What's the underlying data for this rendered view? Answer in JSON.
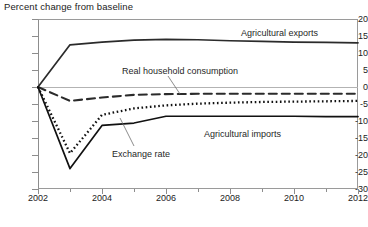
{
  "chart_data": {
    "type": "line",
    "title": "Percent change from baseline",
    "xlabel": "",
    "ylabel": "",
    "xlim": [
      2002,
      2012
    ],
    "ylim": [
      -30,
      20
    ],
    "ytick_values": [
      20,
      15,
      10,
      5,
      0,
      -5,
      -10,
      -15,
      -20,
      -25,
      -30
    ],
    "ytick_labels": [
      "20",
      "15",
      "10",
      "5",
      "0",
      "-5",
      "-10",
      "-15",
      "-20",
      "-25",
      "-30"
    ],
    "xtick_values": [
      2002,
      2004,
      2006,
      2008,
      2010,
      2012
    ],
    "xtick_labels": [
      "2002",
      "2004",
      "2006",
      "2008",
      "2010",
      "2012"
    ],
    "xtick_minor_values": [
      2003,
      2005,
      2007,
      2009,
      2011
    ],
    "grid": false,
    "legend_position": "inline-annotations",
    "x": [
      2002,
      2003,
      2004,
      2005,
      2006,
      2007,
      2008,
      2009,
      2010,
      2011,
      2012
    ],
    "series": [
      {
        "name": "Agricultural exports",
        "style": "solid",
        "color": "#2b2b2b",
        "values": [
          0,
          12.4,
          13.2,
          13.8,
          14.0,
          13.9,
          13.6,
          13.4,
          13.2,
          13.1,
          13.0
        ]
      },
      {
        "name": "Real household consumption",
        "style": "dashed",
        "color": "#2b2b2b",
        "values": [
          0,
          -4.1,
          -3.1,
          -2.3,
          -2.1,
          -2.0,
          -2.0,
          -2.0,
          -2.0,
          -2.0,
          -2.0
        ]
      },
      {
        "name": "Agricultural imports",
        "style": "dotted",
        "color": "#111111",
        "values": [
          0,
          -19.5,
          -8.2,
          -6.3,
          -5.4,
          -4.9,
          -4.6,
          -4.4,
          -4.3,
          -4.2,
          -4.1
        ]
      },
      {
        "name": "Exchange rate",
        "style": "solid",
        "color": "#111111",
        "values": [
          0,
          -24.0,
          -11.3,
          -10.6,
          -8.6,
          -8.6,
          -8.6,
          -8.6,
          -8.6,
          -8.7,
          -8.7
        ]
      }
    ],
    "annotations": [
      {
        "text": "Agricultural exports",
        "x_px": 241,
        "y_px": 28,
        "leader": false
      },
      {
        "text": "Real household consumption",
        "x_px": 122,
        "y_px": 66,
        "leader": true
      },
      {
        "text": "Agricultural imports",
        "x_px": 204,
        "y_px": 129,
        "leader": false
      },
      {
        "text": "Exchange rate",
        "x_px": 112,
        "y_px": 149,
        "leader": true
      }
    ]
  }
}
